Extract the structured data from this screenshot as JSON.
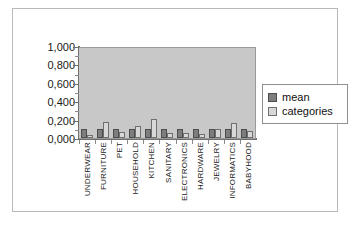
{
  "chart_data": {
    "type": "bar",
    "title": "",
    "xlabel": "",
    "ylabel": "",
    "ylim": [
      0.0,
      1.0
    ],
    "ytick_labels": [
      "1,000",
      "0,800",
      "0,600",
      "0,400",
      "0,200",
      "0,000"
    ],
    "ytick_values": [
      1.0,
      0.8,
      0.6,
      0.4,
      0.2,
      0.0
    ],
    "grid": false,
    "legend_position": "right",
    "categories": [
      "UNDERWEAR",
      "FURNITURE",
      "PET",
      "HOUSEHOLD",
      "KITCHEN",
      "SANITARY",
      "ELECTRONICS",
      "HARDWARE",
      "JEWELRY",
      "INFORMATICS",
      "BABYHOOD"
    ],
    "series": [
      {
        "name": "mean",
        "color": "#7d7d7d",
        "values": [
          0.1,
          0.1,
          0.1,
          0.1,
          0.1,
          0.1,
          0.1,
          0.1,
          0.1,
          0.1,
          0.1
        ]
      },
      {
        "name": "categories",
        "color": "#d8d8d8",
        "values": [
          0.035,
          0.17,
          0.065,
          0.135,
          0.205,
          0.05,
          0.055,
          0.04,
          0.1,
          0.16,
          0.075
        ]
      }
    ]
  },
  "legend": {
    "items": [
      {
        "label": "mean"
      },
      {
        "label": "categories"
      }
    ]
  },
  "colors": {
    "plot_background": "#c8c8c8",
    "page_background": "#ffffff",
    "axis": "#6e6e6e",
    "frame_border": "#b9b9b9"
  }
}
